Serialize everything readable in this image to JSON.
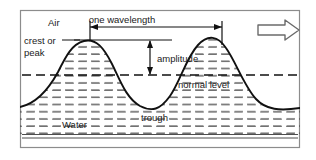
{
  "figure": {
    "kind": "wave-diagram",
    "title_alt": "Water wave diagram showing wavelength, amplitude, crest and trough",
    "frame_color": "#8c8c8c",
    "line_color": "#111111",
    "hatch_color": "#4d4d4d",
    "background": "#ffffff"
  },
  "labels": {
    "air": "Air",
    "wavelength": "one wavelength",
    "crest_line1": "crest or",
    "crest_line2": "peak",
    "amplitude": "amplitude",
    "normal_level": "normal level",
    "trough": "trough",
    "water": "Water"
  },
  "annotations": {
    "direction_arrow": "wave-direction-arrow-right",
    "wavelength_measure": "double-headed-horizontal-arrow",
    "amplitude_measure": "double-headed-vertical-arrow"
  },
  "geometry": {
    "frame": {
      "x": 20,
      "y": 10,
      "width": 280,
      "height": 138
    },
    "normal_level_y": 75,
    "crest_y": 40,
    "trough_y": 107,
    "water_bottom_y": 138,
    "wavelength_start_x": 90,
    "wavelength_end_x": 222,
    "amplitude_x": 150
  }
}
